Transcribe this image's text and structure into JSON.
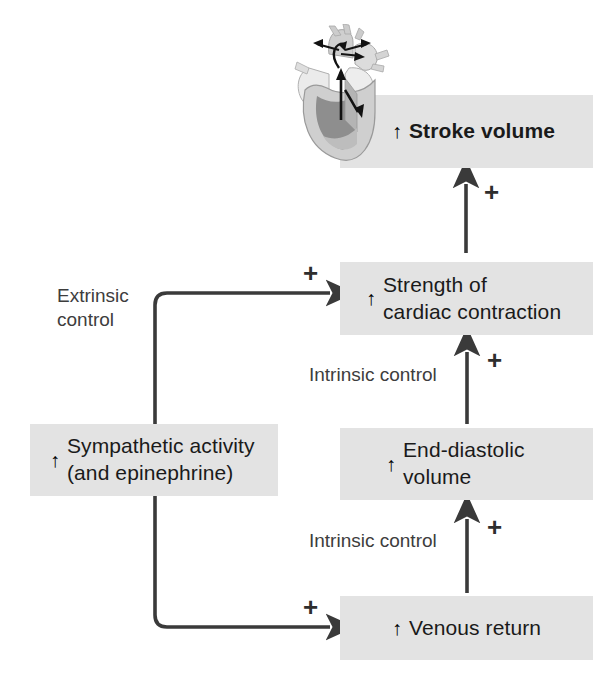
{
  "diagram": {
    "background_color": "#ffffff",
    "box_fill_color": "#e3e3e3",
    "line_color": "#3a3a3a",
    "text_color": "#1a1a1a",
    "label_color": "#3d3d3d",
    "up_arrow_glyph": "↑",
    "plus_sign": "+",
    "boxes": [
      {
        "id": "stroke-volume",
        "text": "Stroke volume",
        "bold": true
      },
      {
        "id": "strength-of-cardiac-contraction",
        "text": "Strength of\ncardiac contraction",
        "bold": false
      },
      {
        "id": "end-diastolic-volume",
        "text": "End-diastolic\nvolume",
        "bold": false
      },
      {
        "id": "venous-return",
        "text": "Venous return",
        "bold": false
      },
      {
        "id": "sympathetic-activity",
        "text": "Sympathetic activity\n(and epinephrine)",
        "bold": false
      }
    ],
    "labels": [
      {
        "id": "extrinsic-control",
        "text": "Extrinsic\ncontrol"
      },
      {
        "id": "intrinsic-control-upper",
        "text": "Intrinsic control"
      },
      {
        "id": "intrinsic-control-lower",
        "text": "Intrinsic control"
      }
    ],
    "plus_signs": [
      {
        "id": "plus-stroke-volume"
      },
      {
        "id": "plus-strength-contraction"
      },
      {
        "id": "plus-end-diastolic"
      },
      {
        "id": "plus-venous-return"
      }
    ],
    "illustration": {
      "id": "heart-cross-section",
      "name": "heart-illustration"
    }
  }
}
